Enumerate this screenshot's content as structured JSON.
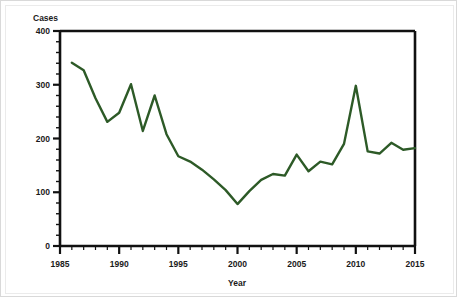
{
  "chart_data": {
    "type": "line",
    "title": "",
    "xlabel": "Year",
    "ylabel": "Cases",
    "xlim": [
      1985,
      2015
    ],
    "ylim": [
      0,
      400
    ],
    "grid": false,
    "legend": false,
    "line_color": "#2d5a27",
    "x": [
      1986,
      1987,
      1988,
      1989,
      1990,
      1991,
      1992,
      1993,
      1994,
      1995,
      1996,
      1997,
      1998,
      1999,
      2000,
      2001,
      2002,
      2003,
      2004,
      2005,
      2006,
      2007,
      2008,
      2009,
      2010,
      2011,
      2012,
      2013,
      2014,
      2015
    ],
    "values": [
      341,
      327,
      275,
      231,
      248,
      301,
      214,
      280,
      208,
      167,
      157,
      142,
      124,
      104,
      78,
      102,
      123,
      134,
      131,
      170,
      139,
      157,
      152,
      190,
      298,
      176,
      172,
      192,
      179,
      182
    ],
    "series": [
      {
        "name": "Cases",
        "color": "#2d5a27",
        "values": [
          341,
          327,
          275,
          231,
          248,
          301,
          214,
          280,
          208,
          167,
          157,
          142,
          124,
          104,
          78,
          102,
          123,
          134,
          131,
          170,
          139,
          157,
          152,
          190,
          298,
          176,
          172,
          192,
          179,
          182
        ]
      }
    ],
    "x_ticks": [
      1985,
      1990,
      1995,
      2000,
      2005,
      2010,
      2015
    ],
    "x_tick_labels": [
      "1985",
      "1990",
      "1995",
      "2000",
      "2005",
      "2010",
      "2015"
    ],
    "y_ticks": [
      0,
      100,
      200,
      300,
      400
    ],
    "y_tick_labels": [
      "0",
      "100",
      "200",
      "300",
      "400"
    ],
    "y_minor_tick_step": 20,
    "x_minor_tick_step": 1,
    "annotations": []
  },
  "axes": {
    "y_axis_title": "Cases",
    "x_axis_title": "Year",
    "y_tick_0": "0",
    "y_tick_1": "100",
    "y_tick_2": "200",
    "y_tick_3": "300",
    "y_tick_4": "400",
    "x_tick_0": "1985",
    "x_tick_1": "1990",
    "x_tick_2": "1995",
    "x_tick_3": "2000",
    "x_tick_4": "2005",
    "x_tick_5": "2010",
    "x_tick_6": "2015"
  },
  "colors": {
    "line": "#2d5a27",
    "axis": "#111111",
    "text": "#1a1a1a",
    "background": "#ffffff",
    "frame": "#d9d9d9"
  }
}
